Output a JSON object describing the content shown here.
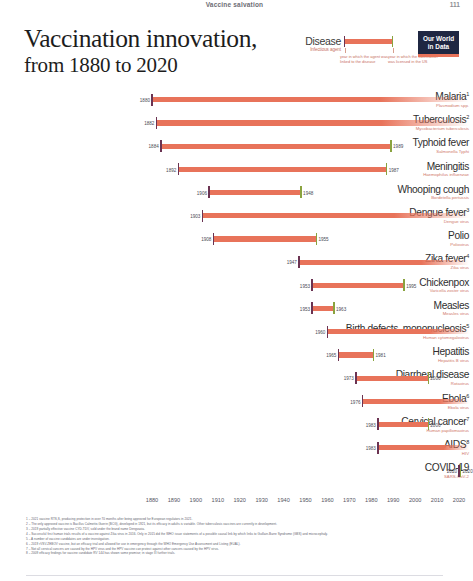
{
  "runhead": {
    "title": "Vaccine salvation",
    "folio": "111"
  },
  "header": {
    "title_line1": "Vaccination innovation,",
    "title_line2": "from 1880 to 2020"
  },
  "legend": {
    "disease_label": "Disease",
    "agent_label": "Infectious agent",
    "note_left": "year in which the agent was linked to the disease",
    "note_right": "year in which the vaccination was licensed in the US",
    "start_cap_color": "#6b3352",
    "end_cap_color": "#8aa33f",
    "bar_color": "#e8735a"
  },
  "logo": {
    "line1": "Our World",
    "line2": "in Data"
  },
  "chart_data": {
    "type": "bar",
    "title": "Vaccination innovation, from 1880 to 2020",
    "xlabel": "",
    "ylabel": "",
    "xlim": [
      1880,
      2020
    ],
    "grid": false,
    "legend_position": "top-right",
    "xticks": [
      "1880",
      "1890",
      "1900",
      "1910",
      "1920",
      "1930",
      "1940",
      "1950",
      "1960",
      "1970",
      "1980",
      "1990",
      "2000",
      "2010",
      "2020"
    ],
    "categories": [
      "Malaria",
      "Tuberculosis",
      "Typhoid fever",
      "Meningitis",
      "Whooping cough",
      "Dengue fever",
      "Polio",
      "Zika fever",
      "Chickenpox",
      "Measles",
      "Birth defects, mononucleosis",
      "Hepatitis",
      "Diarrheal disease",
      "Ebola",
      "Cervical cancer",
      "AIDS",
      "COVID-19"
    ],
    "rows": [
      {
        "disease": "Malaria",
        "superscript": "1",
        "agent": "Plasmodium spp.",
        "start": 1880,
        "end": null,
        "open": true,
        "start_label": "1880",
        "end_label": ""
      },
      {
        "disease": "Tuberculosis",
        "superscript": "2",
        "agent": "Mycobacterium tuberculosis",
        "start": 1882,
        "end": null,
        "open": true,
        "start_label": "1882",
        "end_label": ""
      },
      {
        "disease": "Typhoid fever",
        "superscript": "",
        "agent": "Salmonella Typhi",
        "start": 1884,
        "end": 1989,
        "open": false,
        "start_label": "1884",
        "end_label": "1989"
      },
      {
        "disease": "Meningitis",
        "superscript": "",
        "agent": "Haemophilus influenzae",
        "start": 1892,
        "end": 1987,
        "open": false,
        "start_label": "1892",
        "end_label": "1987"
      },
      {
        "disease": "Whooping cough",
        "superscript": "",
        "agent": "Bordetella pertussis",
        "start": 1906,
        "end": 1948,
        "open": false,
        "start_label": "1906",
        "end_label": "1948"
      },
      {
        "disease": "Dengue fever",
        "superscript": "3",
        "agent": "Dengue virus",
        "start": 1903,
        "end": null,
        "open": true,
        "start_label": "1903",
        "end_label": ""
      },
      {
        "disease": "Polio",
        "superscript": "",
        "agent": "Poliovirus",
        "start": 1908,
        "end": 1955,
        "open": false,
        "start_label": "1908",
        "end_label": "1955"
      },
      {
        "disease": "Zika fever",
        "superscript": "4",
        "agent": "Zika virus",
        "start": 1947,
        "end": null,
        "open": true,
        "start_label": "1947",
        "end_label": ""
      },
      {
        "disease": "Chickenpox",
        "superscript": "",
        "agent": "Varicella zoster virus",
        "start": 1953,
        "end": 1995,
        "open": false,
        "start_label": "1953",
        "end_label": "1995"
      },
      {
        "disease": "Measles",
        "superscript": "",
        "agent": "Measles virus",
        "start": 1953,
        "end": 1963,
        "open": false,
        "start_label": "1953",
        "end_label": "1963"
      },
      {
        "disease": "Birth defects, mononucleosis",
        "superscript": "5",
        "agent": "Human cytomegalovirus",
        "start": 1960,
        "end": null,
        "open": true,
        "start_label": "1960",
        "end_label": ""
      },
      {
        "disease": "Hepatitis",
        "superscript": "",
        "agent": "Hepatitis B virus",
        "start": 1965,
        "end": 1981,
        "open": false,
        "start_label": "1965",
        "end_label": "1981"
      },
      {
        "disease": "Diarrheal disease",
        "superscript": "",
        "agent": "Rotavirus",
        "start": 1973,
        "end": 2006,
        "open": false,
        "start_label": "1973",
        "end_label": "2006"
      },
      {
        "disease": "Ebola",
        "superscript": "6",
        "agent": "Ebola virus",
        "start": 1976,
        "end": null,
        "open": true,
        "start_label": "1976",
        "end_label": ""
      },
      {
        "disease": "Cervical cancer",
        "superscript": "7",
        "agent": "Human papillomavirus",
        "start": 1983,
        "end": 2006,
        "open": false,
        "start_label": "1983",
        "end_label": "2006"
      },
      {
        "disease": "AIDS",
        "superscript": "8",
        "agent": "HIV",
        "start": 1983,
        "end": null,
        "open": true,
        "start_label": "1983",
        "end_label": ""
      },
      {
        "disease": "COVID-19",
        "superscript": "",
        "agent": "SARS-CoV-2",
        "start": 2020,
        "end": 2020,
        "open": false,
        "start_label": "2020",
        "end_label": "2020"
      }
    ]
  },
  "footnotes": [
    "1 – 2021 vaccine RTS,S, producing protection in over 70 months after being approved for European regulators in 2021.",
    "2 – The only approved vaccine is Bacillus Calmette-Guerin (BCG), developed in 1921, but its efficacy in adults is variable. Other tuberculosis vaccines are currently in development.",
    "3 – 2019 partially effective vaccine CYD-TDV, sold under the brand name Dengvaxia.",
    "4 – Successful first human trials results of a vaccine against Zika virus in 2016. Only in 2015 did the WHO issue statements of a possible causal link by which links to Guillain-Barre Syndrome (GBS) and microcephaly.",
    "5 – A number of vaccine candidates are under investigation.",
    "6 – 2019 rVSV-ZEBOV vaccine, but an efficacy trial and allowed for use in emergency through the WHO Emergency Use Assessment and Listing (EUAL).",
    "7 – Not all cervical cancers are caused by the HPV virus and the HPV vaccine can protect against other cancers caused by the HPV virus.",
    "8 – 2009 efficacy findings for vaccine candidate RV 144 has shown some promise; in stage III further trials."
  ]
}
